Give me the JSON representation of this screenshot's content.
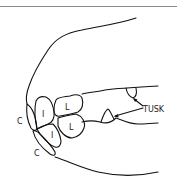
{
  "diagram": {
    "line_color": "#111111",
    "labels": {
      "upper_corner": "C",
      "upper_incisor": "I",
      "upper_lateral": "L",
      "lower_incisor": "I",
      "lower_lateral": "L",
      "lower_corner": "C",
      "tusk": "TUSK"
    }
  }
}
